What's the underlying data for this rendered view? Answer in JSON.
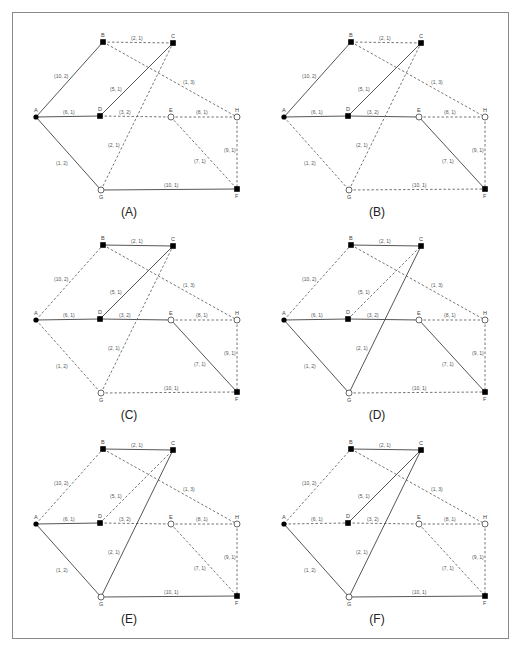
{
  "figure": {
    "panels": [
      {
        "caption": "(A)",
        "offset": [
          0,
          0
        ],
        "solid": [
          "A-B",
          "A-D",
          "D-C",
          "A-G",
          "G-F"
        ]
      },
      {
        "caption": "(B)",
        "offset": [
          248,
          0
        ],
        "solid": [
          "A-B",
          "A-D",
          "D-C",
          "D-E",
          "E-F"
        ]
      },
      {
        "caption": "(C)",
        "offset": [
          0,
          203
        ],
        "solid": [
          "B-C",
          "A-D",
          "D-C",
          "D-E",
          "E-F"
        ]
      },
      {
        "caption": "(D)",
        "offset": [
          248,
          203
        ],
        "solid": [
          "B-C",
          "A-D",
          "D-E",
          "E-F",
          "A-G",
          "G-C"
        ]
      },
      {
        "caption": "(E)",
        "offset": [
          0,
          407
        ],
        "solid": [
          "B-C",
          "A-D",
          "A-G",
          "G-C",
          "G-F"
        ]
      },
      {
        "caption": "(F)",
        "offset": [
          248,
          407
        ],
        "solid": [
          "B-C",
          "D-C",
          "A-G",
          "G-C",
          "G-F"
        ]
      }
    ],
    "nodes": [
      {
        "id": "A",
        "x": 36,
        "y": 117,
        "shape": "filled-circle",
        "lx": -2,
        "ly": -5
      },
      {
        "id": "B",
        "x": 103,
        "y": 42,
        "shape": "filled-square",
        "lx": -2,
        "ly": -5
      },
      {
        "id": "C",
        "x": 173,
        "y": 43,
        "shape": "filled-square",
        "lx": -2,
        "ly": -5
      },
      {
        "id": "D",
        "x": 100,
        "y": 116,
        "shape": "filled-square",
        "lx": -2,
        "ly": -5
      },
      {
        "id": "E",
        "x": 171,
        "y": 117,
        "shape": "open-circle",
        "lx": -2,
        "ly": -5
      },
      {
        "id": "H",
        "x": 237,
        "y": 117,
        "shape": "open-circle",
        "lx": -2,
        "ly": -5
      },
      {
        "id": "G",
        "x": 101,
        "y": 190,
        "shape": "open-circle",
        "lx": -2,
        "ly": 9
      },
      {
        "id": "F",
        "x": 237,
        "y": 189,
        "shape": "filled-square",
        "lx": -2,
        "ly": 9
      }
    ],
    "edges": [
      {
        "id": "A-B",
        "from": "A",
        "to": "B",
        "label": "(10, 2)",
        "lx": 54,
        "ly": 78
      },
      {
        "id": "B-C",
        "from": "B",
        "to": "C",
        "label": "(2, 1)",
        "lx": 131,
        "ly": 40
      },
      {
        "id": "B-H",
        "from": "B",
        "to": "H",
        "label": "(1, 3)",
        "lx": 183,
        "ly": 84
      },
      {
        "id": "A-D",
        "from": "A",
        "to": "D",
        "label": "(6, 1)",
        "lx": 63,
        "ly": 114
      },
      {
        "id": "D-C",
        "from": "D",
        "to": "C",
        "label": "(5, 1)",
        "lx": 110,
        "ly": 91
      },
      {
        "id": "D-E",
        "from": "D",
        "to": "E",
        "label": "(3, 2)",
        "lx": 119,
        "ly": 114
      },
      {
        "id": "E-H",
        "from": "E",
        "to": "H",
        "label": "(8, 1)",
        "lx": 196,
        "ly": 114
      },
      {
        "id": "G-C",
        "from": "G",
        "to": "C",
        "label": "(2, 1)",
        "lx": 108,
        "ly": 147
      },
      {
        "id": "A-G",
        "from": "A",
        "to": "G",
        "label": "(1, 2)",
        "lx": 56,
        "ly": 165
      },
      {
        "id": "E-F",
        "from": "E",
        "to": "F",
        "label": "(7, 1)",
        "lx": 194,
        "ly": 163
      },
      {
        "id": "H-F",
        "from": "H",
        "to": "F",
        "label": "(9, 1)",
        "lx": 224,
        "ly": 152
      },
      {
        "id": "G-F",
        "from": "G",
        "to": "F",
        "label": "(10, 1)",
        "lx": 164,
        "ly": 187
      }
    ],
    "caption_pos": {
      "x": 129,
      "y": 216
    },
    "colors": {
      "solid": "#555555",
      "dashed": "#777777",
      "node_fill": "#000000",
      "frame": "#8a8a8a"
    }
  }
}
